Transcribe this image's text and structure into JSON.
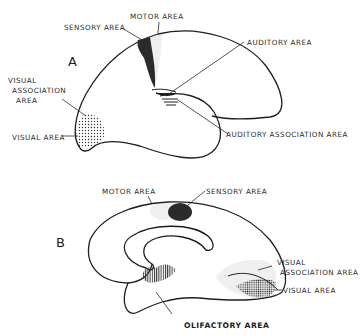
{
  "figure_a": {
    "letter": "A",
    "labels": {
      "motor_area": "MOTOR AREA",
      "sensory_area": "SENSORY AREA",
      "auditory_area": "AUDITORY AREA",
      "visual_association_1": "VISUAL",
      "visual_association_2": "ASSOCIATION",
      "visual_association_3": "AREA",
      "visual_area": "VISUAL AREA",
      "auditory_association_area": "AUDITORY ASSOCIATION AREA"
    }
  },
  "figure_b": {
    "letter": "B",
    "labels": {
      "motor_area": "MOTOR AREA",
      "sensory_area": "SENSORY AREA",
      "visual_association_1": "VISUAL",
      "visual_association_2": "ASSOCIATION AREA",
      "visual_area": "VISUAL AREA",
      "olfactory_area": "OLIFACTORY AREA"
    }
  },
  "colors": {
    "ink": "#1e1e1e",
    "dark_fill": "#2b2b2b",
    "stipple": "#444444",
    "background": "#ffffff"
  }
}
